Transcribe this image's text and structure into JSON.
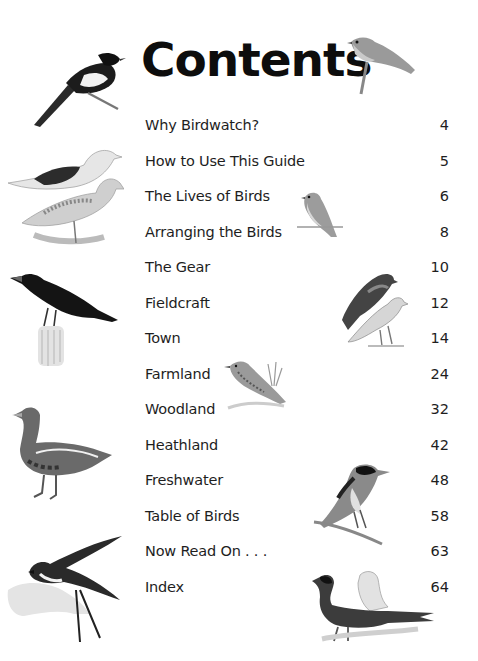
{
  "page": {
    "title": "Contents"
  },
  "toc": {
    "entries": [
      {
        "label": "Why Birdwatch?",
        "page": "4"
      },
      {
        "label": "How to Use This Guide",
        "page": "5"
      },
      {
        "label": "The Lives of Birds",
        "page": "6"
      },
      {
        "label": "Arranging the Birds",
        "page": "8"
      },
      {
        "label": "The Gear",
        "page": "10"
      },
      {
        "label": "Fieldcraft",
        "page": "12"
      },
      {
        "label": "Town",
        "page": "14"
      },
      {
        "label": "Farmland",
        "page": "24"
      },
      {
        "label": "Woodland",
        "page": "32"
      },
      {
        "label": "Heathland",
        "page": "42"
      },
      {
        "label": "Freshwater",
        "page": "48"
      },
      {
        "label": "Table of Birds",
        "page": "58"
      },
      {
        "label": "Now Read On . . .",
        "page": "63"
      },
      {
        "label": "Index",
        "page": "64"
      }
    ]
  },
  "illustrations": [
    {
      "name": "magpie",
      "position": "top-left"
    },
    {
      "name": "robin",
      "position": "top-right"
    },
    {
      "name": "gulls",
      "position": "left"
    },
    {
      "name": "finch",
      "position": "center"
    },
    {
      "name": "sparrowhawk-pair",
      "position": "right"
    },
    {
      "name": "rook",
      "position": "left"
    },
    {
      "name": "skylark",
      "position": "center"
    },
    {
      "name": "goose",
      "position": "left"
    },
    {
      "name": "stonechat",
      "position": "right"
    },
    {
      "name": "swallow",
      "position": "bottom-left"
    },
    {
      "name": "pheasants",
      "position": "bottom-right"
    }
  ],
  "colors": {
    "text": "#1e1e1e",
    "background": "#ffffff"
  }
}
